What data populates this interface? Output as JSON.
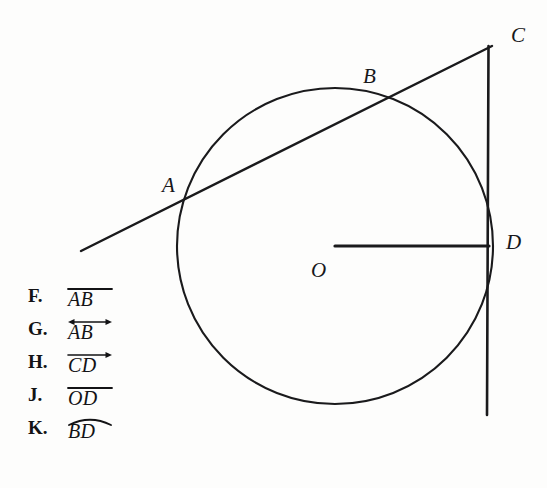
{
  "figure": {
    "name": "circle-with-secant-and-tangent",
    "background_color": "#fdfdfc",
    "ink_color": "#1a1a1c",
    "circle": {
      "cx": 335,
      "cy": 246,
      "r": 158
    },
    "points": [
      {
        "id": "A",
        "label": "A",
        "x": 185,
        "y": 197,
        "label_x": 162,
        "label_y": 175
      },
      {
        "id": "B",
        "label": "B",
        "x": 376,
        "y": 95,
        "label_x": 363,
        "label_y": 66
      },
      {
        "id": "C",
        "label": "C",
        "x": 489,
        "y": 48,
        "label_x": 511,
        "label_y": 25
      },
      {
        "id": "D",
        "label": "D",
        "x": 489,
        "y": 246,
        "label_x": 506,
        "label_y": 232
      },
      {
        "id": "O",
        "label": "O",
        "x": 335,
        "y": 246,
        "label_x": 311,
        "label_y": 260
      }
    ],
    "segments": [
      {
        "name": "secant-line-through-A-B-to-C",
        "x1": 81,
        "y1": 251,
        "x2": 492,
        "y2": 46
      },
      {
        "name": "tangent-line-at-D-through-C",
        "x1": 488,
        "y1": 46,
        "x2": 487,
        "y2": 415
      },
      {
        "name": "radius-O-to-D",
        "x1": 335,
        "y1": 246,
        "x2": 489,
        "y2": 246
      }
    ]
  },
  "choices": [
    {
      "letter": "F.",
      "text": "AB",
      "notation": "segment",
      "decoration": "overbar"
    },
    {
      "letter": "G.",
      "text": "AB",
      "notation": "line",
      "decoration": "double-arrow"
    },
    {
      "letter": "H.",
      "text": "CD",
      "notation": "ray",
      "decoration": "right-arrow"
    },
    {
      "letter": "J.",
      "text": "OD",
      "notation": "segment",
      "decoration": "overbar"
    },
    {
      "letter": "K.",
      "text": "BD",
      "notation": "arc",
      "decoration": "arc"
    }
  ]
}
